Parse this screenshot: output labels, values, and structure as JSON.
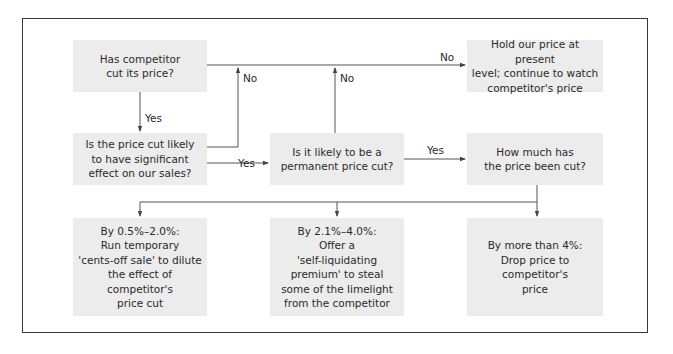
{
  "diagram": {
    "type": "flowchart",
    "nodes": {
      "q1": "Has competitor\ncut its price?",
      "q2": "Is the price cut likely\nto have significant\neffect on our sales?",
      "q3": "Is it likely to be a\npermanent price cut?",
      "hold": "Hold our price at present\nlevel; continue to watch\ncompetitor's price",
      "q4": "How much has\nthe price been cut?",
      "a1": "By 0.5%–2.0%:\nRun temporary\n'cents-off sale' to dilute\nthe effect of\ncompetitor's\nprice cut",
      "a2": "By 2.1%–4.0%:\nOffer a\n'self-liquidating\npremium' to steal\nsome of the limelight\nfrom the competitor",
      "a3": "By more than 4%:\nDrop price to\ncompetitor's\nprice"
    },
    "edge_labels": {
      "q1_no": "No",
      "q1_yes": "Yes",
      "q2_no": "No",
      "q2_yes": "Yes",
      "q3_no": "No",
      "q3_yes": "Yes"
    },
    "edges": [
      {
        "from": "q1",
        "to": "hold",
        "label": "No"
      },
      {
        "from": "q1",
        "to": "q2",
        "label": "Yes"
      },
      {
        "from": "q2",
        "to": "hold",
        "label": "No"
      },
      {
        "from": "q2",
        "to": "q3",
        "label": "Yes"
      },
      {
        "from": "q3",
        "to": "hold",
        "label": "No"
      },
      {
        "from": "q3",
        "to": "q4",
        "label": "Yes"
      },
      {
        "from": "q4",
        "to": "a1",
        "label": ""
      },
      {
        "from": "q4",
        "to": "a2",
        "label": ""
      },
      {
        "from": "q4",
        "to": "a3",
        "label": ""
      }
    ],
    "colors": {
      "node_fill": "#ececec",
      "line": "#555555",
      "frame": "#3a3a3a"
    }
  }
}
